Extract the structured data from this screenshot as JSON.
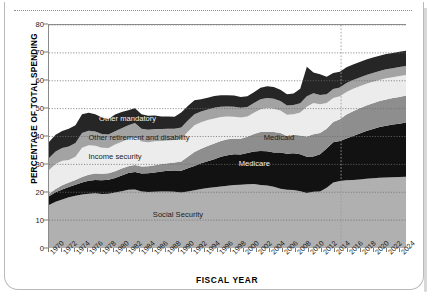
{
  "chart_data": {
    "type": "area",
    "stacked": true,
    "title": "",
    "xlabel": "FISCAL YEAR",
    "ylabel": "PERCENTAGE OF TOTAL SPENDING",
    "ylim": [
      0,
      80
    ],
    "ytick_values": [
      0,
      10,
      20,
      30,
      40,
      50,
      60,
      70,
      80
    ],
    "ytick_labels": [
      "0",
      "10",
      "20",
      "30",
      "40",
      "50",
      "60",
      "70",
      "80"
    ],
    "xlim": [
      1970,
      2025
    ],
    "xtick_labels": [
      "1970",
      "1972",
      "1974",
      "1976",
      "1978",
      "1980",
      "1982",
      "1984",
      "1986",
      "1988",
      "1990",
      "1992",
      "1994",
      "1996",
      "1998",
      "2000",
      "2002",
      "2004",
      "2006",
      "2008",
      "2010",
      "2012",
      "2014",
      "2016",
      "2018",
      "2020",
      "2022",
      "2024"
    ],
    "grid": "horizontal-dotted",
    "legend_position": "inline-on-bands",
    "projection_divider_year": 2015,
    "x": [
      1970,
      1971,
      1972,
      1973,
      1974,
      1975,
      1976,
      1977,
      1978,
      1979,
      1980,
      1981,
      1982,
      1983,
      1984,
      1985,
      1986,
      1987,
      1988,
      1989,
      1990,
      1991,
      1992,
      1993,
      1994,
      1995,
      1996,
      1997,
      1998,
      1999,
      2000,
      2001,
      2002,
      2003,
      2004,
      2005,
      2006,
      2007,
      2008,
      2009,
      2010,
      2011,
      2012,
      2013,
      2014,
      2015,
      2016,
      2017,
      2018,
      2019,
      2020,
      2021,
      2022,
      2023,
      2024
    ],
    "series": [
      {
        "name": "Social Security",
        "color": "#b0b0b0",
        "label_color": "dark",
        "values": [
          15.4,
          16.6,
          17.4,
          18.2,
          18.7,
          19.2,
          19.5,
          19.6,
          19.4,
          19.5,
          19.9,
          20.4,
          20.9,
          21.0,
          20.3,
          20.1,
          20.2,
          20.3,
          20.3,
          20.2,
          19.9,
          20.3,
          20.7,
          21.2,
          21.5,
          21.8,
          22.1,
          22.3,
          22.6,
          22.7,
          22.9,
          23.0,
          22.6,
          22.4,
          22.0,
          21.3,
          20.9,
          20.8,
          20.4,
          19.7,
          20.2,
          20.3,
          21.6,
          23.5,
          24.0,
          24.3,
          24.4,
          24.6,
          24.8,
          25.0,
          25.2,
          25.3,
          25.4,
          25.5,
          25.6
        ]
      },
      {
        "name": "Medicare",
        "color": "#121212",
        "label_color": "light",
        "values": [
          3.2,
          3.4,
          3.6,
          3.7,
          4.0,
          4.3,
          4.6,
          4.8,
          4.9,
          5.0,
          5.2,
          5.6,
          6.0,
          6.3,
          6.4,
          6.7,
          6.9,
          7.1,
          7.4,
          7.6,
          7.8,
          8.3,
          8.7,
          9.2,
          9.6,
          10.0,
          10.6,
          11.0,
          11.0,
          10.8,
          11.2,
          11.6,
          12.2,
          12.3,
          12.3,
          13.0,
          12.9,
          13.2,
          13.2,
          13.0,
          12.6,
          13.3,
          14.1,
          14.4,
          14.4,
          15.0,
          15.8,
          16.5,
          17.2,
          17.7,
          18.2,
          18.6,
          18.9,
          19.1,
          19.4
        ]
      },
      {
        "name": "Medicaid",
        "color": "#8e8e8e",
        "label_color": "dark",
        "values": [
          0.9,
          1.2,
          1.5,
          1.6,
          1.7,
          2.0,
          2.2,
          2.3,
          2.3,
          2.3,
          2.4,
          2.5,
          2.4,
          2.5,
          2.5,
          2.5,
          2.6,
          2.7,
          2.7,
          2.9,
          3.3,
          4.1,
          5.0,
          5.2,
          5.5,
          5.7,
          5.7,
          5.7,
          5.6,
          5.7,
          5.8,
          6.3,
          6.8,
          7.0,
          7.3,
          7.0,
          6.4,
          6.6,
          6.8,
          7.3,
          8.0,
          7.7,
          7.1,
          7.3,
          7.8,
          8.6,
          8.9,
          9.0,
          9.1,
          9.2,
          9.3,
          9.4,
          9.5,
          9.6,
          9.7
        ]
      },
      {
        "name": "Income security",
        "color": "#ececec",
        "label_color": "dark",
        "values": [
          8.5,
          8.9,
          8.8,
          8.1,
          8.3,
          10.5,
          10.6,
          10.0,
          9.4,
          9.1,
          9.6,
          9.6,
          9.8,
          10.2,
          9.0,
          8.6,
          8.6,
          8.3,
          8.2,
          8.0,
          8.2,
          9.0,
          9.6,
          9.5,
          9.3,
          9.0,
          8.6,
          8.2,
          7.9,
          7.6,
          7.3,
          7.6,
          8.2,
          8.5,
          8.4,
          8.0,
          7.6,
          7.4,
          8.2,
          10.7,
          11.2,
          10.3,
          9.2,
          8.6,
          8.2,
          8.1,
          8.0,
          7.9,
          7.8,
          7.7,
          7.6,
          7.6,
          7.5,
          7.5,
          7.4
        ]
      },
      {
        "name": "Other retirement and disability",
        "color": "#a3a3a3",
        "label_color": "dark",
        "values": [
          4.3,
          4.5,
          4.6,
          4.8,
          5.0,
          5.3,
          5.2,
          5.1,
          4.9,
          4.8,
          4.8,
          4.9,
          4.9,
          4.8,
          4.6,
          4.5,
          4.4,
          4.3,
          4.2,
          4.1,
          4.0,
          4.0,
          4.0,
          3.9,
          3.8,
          3.8,
          3.7,
          3.6,
          3.6,
          3.5,
          3.4,
          3.5,
          3.6,
          3.6,
          3.5,
          3.4,
          3.3,
          3.3,
          3.3,
          3.7,
          3.5,
          3.3,
          3.2,
          3.2,
          3.2,
          3.2,
          3.2,
          3.2,
          3.2,
          3.2,
          3.2,
          3.2,
          3.2,
          3.2,
          3.2
        ]
      },
      {
        "name": "Other mandatory",
        "color": "#262626",
        "label_color": "light",
        "values": [
          5.7,
          6.0,
          6.1,
          6.4,
          6.3,
          6.7,
          6.4,
          6.2,
          5.9,
          5.6,
          6.0,
          5.8,
          5.4,
          5.3,
          5.2,
          5.0,
          4.8,
          4.5,
          4.4,
          4.3,
          5.4,
          5.2,
          5.0,
          4.4,
          4.2,
          4.2,
          4.1,
          4.0,
          4.0,
          3.9,
          3.8,
          3.9,
          4.1,
          4.2,
          4.3,
          4.1,
          4.1,
          4.1,
          5.2,
          10.6,
          7.5,
          7.4,
          6.2,
          5.8,
          5.6,
          5.6,
          5.5,
          5.5,
          5.5,
          5.5,
          5.5,
          5.5,
          5.5,
          5.5,
          5.5
        ]
      }
    ],
    "annotations": [
      {
        "text": "Social Security",
        "x_frac": 0.29,
        "y_value": 12.0,
        "tone": "dark"
      },
      {
        "text": "Medicare",
        "x_frac": 0.53,
        "y_value": 30.5,
        "tone": "light"
      },
      {
        "text": "Medicaid",
        "x_frac": 0.6,
        "y_value": 39.5,
        "tone": "dark"
      },
      {
        "text": "Income security",
        "x_frac": 0.11,
        "y_value": 33.0,
        "tone": "dark"
      },
      {
        "text": "Other retirement and disability",
        "x_frac": 0.11,
        "y_value": 39.5,
        "tone": "dark"
      },
      {
        "text": "Other mandatory",
        "x_frac": 0.14,
        "y_value": 46.5,
        "tone": "light"
      }
    ]
  }
}
